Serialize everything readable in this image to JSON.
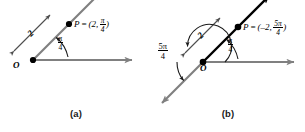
{
  "figure": {
    "type": "math-diagram",
    "background_color": "#ffffff",
    "ink_color": "#000000",
    "axis_color": "#808080"
  },
  "panels": [
    {
      "id": "a",
      "caption": "(a)",
      "origin_label": "O",
      "radius_label": "2",
      "angle": {
        "numerator": "π",
        "denominator": "4",
        "text": "π/4"
      },
      "point": {
        "name": "P",
        "equals": "=",
        "open_paren": "(",
        "r": "2",
        "comma": ",",
        "theta_numerator": "π",
        "theta_denominator": "4",
        "close_paren": ")",
        "full_text": "P = (2, π/4)"
      },
      "rays": [
        {
          "name": "polar-axis",
          "direction": "right",
          "color": "#808080",
          "arrow": true
        },
        {
          "name": "terminal-ray",
          "direction": "up-right-45",
          "color": "#808080",
          "arrow": true
        }
      ],
      "measure_arrow": {
        "name": "radius-measure",
        "label": "2",
        "double_headed": true
      }
    },
    {
      "id": "b",
      "caption": "(b)",
      "origin_label": "O",
      "radius_label": "2",
      "angle_small": {
        "numerator": "π",
        "denominator": "4",
        "text": "π/4"
      },
      "angle_large": {
        "numerator": "5π",
        "denominator": "4",
        "text": "5π/4"
      },
      "point": {
        "name": "P",
        "equals": "=",
        "open_paren": "(",
        "r": "–2",
        "comma": ",",
        "theta_numerator": "5π",
        "theta_denominator": "4",
        "close_paren": ")",
        "full_text": "P = (–2, 5π/4)"
      },
      "rays": [
        {
          "name": "polar-axis",
          "direction": "right",
          "color": "#808080",
          "arrow": true
        },
        {
          "name": "terminal-ray",
          "direction": "down-left-225",
          "color": "#808080",
          "arrow": true
        },
        {
          "name": "point-ray",
          "direction": "up-right-45",
          "color": "#000000",
          "arrow": true
        }
      ],
      "measure_arrow": {
        "name": "radius-measure",
        "label": "2",
        "double_headed": true
      }
    }
  ]
}
